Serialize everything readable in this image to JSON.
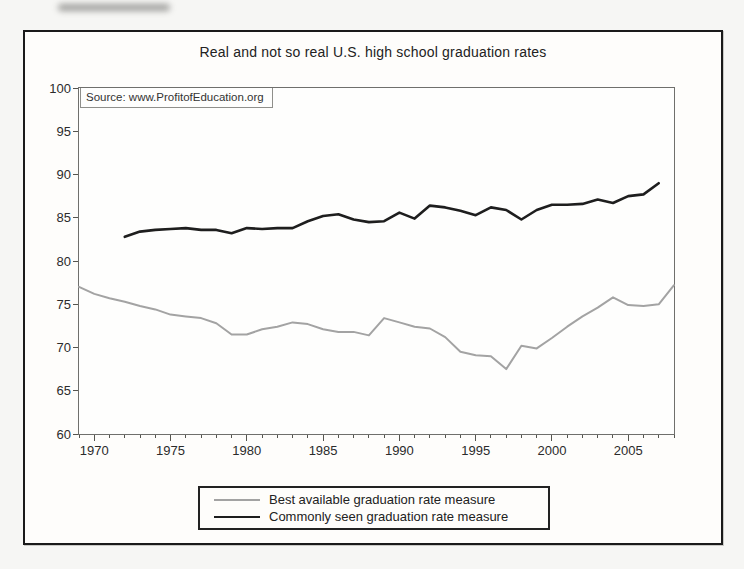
{
  "figure": {
    "title": "Real and not so real U.S. high school graduation rates",
    "source_note": "Source: www.ProfitofEducation.org"
  },
  "chart_data": {
    "type": "line",
    "title": "Real and not so real U.S. high school graduation rates",
    "annotation": "Source: www.ProfitofEducation.org",
    "xlabel": "",
    "ylabel": "",
    "x_range": [
      1969,
      2008
    ],
    "y_range": [
      60,
      100
    ],
    "y_ticks": [
      100,
      95,
      90,
      85,
      80,
      75,
      70,
      65,
      60
    ],
    "x_ticks": [
      1970,
      1975,
      1980,
      1985,
      1990,
      1995,
      2000,
      2005
    ],
    "minor_x_tick_step": 1,
    "grid": false,
    "legend_position": "bottom-center-boxed",
    "series": [
      {
        "name": "Best available graduation rate measure",
        "color": "#a3a3a3",
        "stroke_width": 2,
        "years": [
          1969,
          1970,
          1971,
          1972,
          1973,
          1974,
          1975,
          1976,
          1977,
          1978,
          1979,
          1980,
          1981,
          1982,
          1983,
          1984,
          1985,
          1986,
          1987,
          1988,
          1989,
          1990,
          1991,
          1992,
          1993,
          1994,
          1995,
          1996,
          1997,
          1998,
          1999,
          2000,
          2001,
          2002,
          2003,
          2004,
          2005,
          2006,
          2007,
          2008
        ],
        "values": [
          77.0,
          76.2,
          75.7,
          75.3,
          74.8,
          74.4,
          73.8,
          73.6,
          73.4,
          72.8,
          71.5,
          71.5,
          72.1,
          72.4,
          72.9,
          72.7,
          72.1,
          71.8,
          71.8,
          71.4,
          73.4,
          72.9,
          72.4,
          72.2,
          71.2,
          69.5,
          69.1,
          69.0,
          67.5,
          70.2,
          69.9,
          71.1,
          72.4,
          73.6,
          74.6,
          75.8,
          74.9,
          74.8,
          75.0,
          77.2
        ]
      },
      {
        "name": "Commonly seen graduation rate measure",
        "color": "#1e1e1e",
        "stroke_width": 2.6,
        "years": [
          1972,
          1973,
          1974,
          1975,
          1976,
          1977,
          1978,
          1979,
          1980,
          1981,
          1982,
          1983,
          1984,
          1985,
          1986,
          1987,
          1988,
          1989,
          1990,
          1991,
          1992,
          1993,
          1994,
          1995,
          1996,
          1997,
          1998,
          1999,
          2000,
          2001,
          2002,
          2003,
          2004,
          2005,
          2006,
          2007
        ],
        "values": [
          82.8,
          83.4,
          83.6,
          83.7,
          83.8,
          83.6,
          83.6,
          83.2,
          83.8,
          83.7,
          83.8,
          83.8,
          84.6,
          85.2,
          85.4,
          84.8,
          84.5,
          84.6,
          85.6,
          84.9,
          86.4,
          86.2,
          85.8,
          85.3,
          86.2,
          85.9,
          84.8,
          85.9,
          86.5,
          86.5,
          86.6,
          87.1,
          86.7,
          87.5,
          87.7,
          89.0
        ]
      }
    ]
  }
}
